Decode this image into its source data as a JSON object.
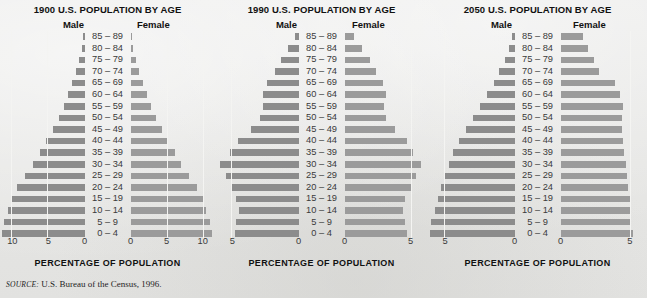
{
  "figure": {
    "axis_title": "PERCENTAGE OF POPULATION",
    "source_label": "SOURCE:",
    "source_text": "U.S. Bureau of the Census, 1996.",
    "male_label": "Male",
    "female_label": "Female",
    "bar_color_male": "#8c8c8c",
    "bar_color_female": "#9b9b9b",
    "background_color": "#e8e8e6",
    "gridline_color": "#f4f4f2"
  },
  "chart_data": [
    {
      "type": "bar",
      "orientation": "population-pyramid",
      "title": "1900 U.S. POPULATION BY AGE",
      "xlabel": "PERCENTAGE OF POPULATION",
      "ylabel": "",
      "grid": true,
      "legend_position": "top",
      "xlim": [
        0,
        11.5
      ],
      "xticks": [
        10,
        5,
        0
      ],
      "categories": [
        "85 – 89",
        "80 – 84",
        "75 – 79",
        "70 – 74",
        "65 – 69",
        "60 – 64",
        "55 – 59",
        "50 – 54",
        "45 – 49",
        "40 – 44",
        "35 – 39",
        "30 – 34",
        "25 – 29",
        "20 – 24",
        "15 – 19",
        "10 – 14",
        "5 – 9",
        "0 – 4"
      ],
      "series": [
        {
          "name": "Male",
          "values": [
            0.2,
            0.4,
            0.7,
            1.2,
            1.7,
            2.3,
            2.9,
            3.6,
            4.4,
            5.3,
            6.2,
            7.1,
            8.2,
            9.3,
            10.1,
            10.6,
            11.1,
            11.4
          ]
        },
        {
          "name": "Female",
          "values": [
            0.2,
            0.4,
            0.7,
            1.2,
            1.7,
            2.3,
            2.9,
            3.6,
            4.4,
            5.2,
            6.1,
            7.0,
            8.1,
            9.2,
            10.0,
            10.5,
            11.0,
            11.3
          ]
        }
      ]
    },
    {
      "type": "bar",
      "orientation": "population-pyramid",
      "title": "1990 U.S. POPULATION BY AGE",
      "xlabel": "PERCENTAGE OF POPULATION",
      "ylabel": "",
      "grid": true,
      "legend_position": "top",
      "xlim": [
        0,
        6.2
      ],
      "xticks": [
        5,
        0
      ],
      "categories": [
        "85 – 89",
        "80 – 84",
        "75 – 79",
        "70 – 74",
        "65 – 69",
        "60 – 64",
        "55 – 59",
        "50 – 54",
        "45 – 49",
        "40 – 44",
        "35 – 39",
        "30 – 34",
        "25 – 29",
        "20 – 24",
        "15 – 19",
        "10 – 14",
        "5 – 9",
        "0 – 4"
      ],
      "series": [
        {
          "name": "Male",
          "values": [
            0.3,
            0.8,
            1.3,
            1.8,
            2.4,
            2.7,
            2.7,
            2.9,
            3.6,
            4.6,
            5.2,
            5.9,
            5.5,
            5.1,
            4.7,
            4.5,
            4.7,
            4.8
          ]
        },
        {
          "name": "Female",
          "values": [
            0.7,
            1.3,
            1.9,
            2.4,
            2.9,
            3.1,
            3.0,
            3.1,
            3.8,
            4.7,
            5.2,
            5.8,
            5.4,
            5.0,
            4.6,
            4.4,
            4.6,
            4.7
          ]
        }
      ]
    },
    {
      "type": "bar",
      "orientation": "population-pyramid",
      "title": "2050 U.S. POPULATION BY AGE",
      "xlabel": "PERCENTAGE OF POPULATION",
      "ylabel": "",
      "grid": true,
      "legend_position": "top",
      "xlim": [
        0,
        6.2
      ],
      "xticks": [
        5,
        0
      ],
      "categories": [
        "85 – 89",
        "80 – 84",
        "75 – 79",
        "70 – 74",
        "65 – 69",
        "60 – 64",
        "55 – 59",
        "50 – 54",
        "45 – 49",
        "40 – 44",
        "35 – 39",
        "30 – 34",
        "25 – 29",
        "20 – 24",
        "15 – 19",
        "10 – 14",
        "5 – 9",
        "0 – 4"
      ],
      "series": [
        {
          "name": "Male",
          "values": [
            0.2,
            0.4,
            0.7,
            1.1,
            1.5,
            2.0,
            2.5,
            3.0,
            3.5,
            4.0,
            4.4,
            4.7,
            5.0,
            5.3,
            5.5,
            5.7,
            6.0,
            6.1
          ]
        },
        {
          "name": "Female",
          "values": [
            1.6,
            2.0,
            2.4,
            2.8,
            3.9,
            4.3,
            4.5,
            4.4,
            4.4,
            4.5,
            4.6,
            4.7,
            4.8,
            4.9,
            5.0,
            5.1,
            5.1,
            5.2
          ]
        }
      ]
    }
  ]
}
